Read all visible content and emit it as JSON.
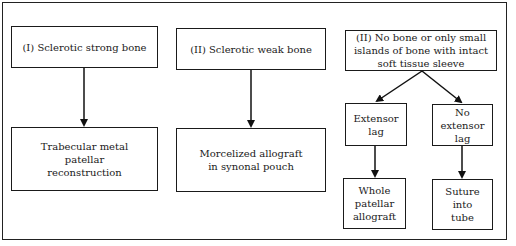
{
  "diagram": {
    "nodes": {
      "type1": "(I) Sclerotic strong bone",
      "type2": "(II) Sclerotic weak bone",
      "type3": "(II) No bone or only small islands of bone with intact soft tissue sleeve",
      "trabecular": "Trabecular metal patellar reconstruction",
      "morcelized": "Morcelized allograft in synonal pouch",
      "extensor_lag": "Extensor lag",
      "no_extensor_lag": "No extensor lag",
      "whole_allograft": "Whole patellar allograft",
      "suture_tube": "Suture into tube"
    },
    "edges": [
      {
        "from": "type1",
        "to": "trabecular"
      },
      {
        "from": "type2",
        "to": "morcelized"
      },
      {
        "from": "type3",
        "to": "extensor_lag"
      },
      {
        "from": "type3",
        "to": "no_extensor_lag"
      },
      {
        "from": "extensor_lag",
        "to": "whole_allograft"
      },
      {
        "from": "no_extensor_lag",
        "to": "suture_tube"
      }
    ]
  }
}
